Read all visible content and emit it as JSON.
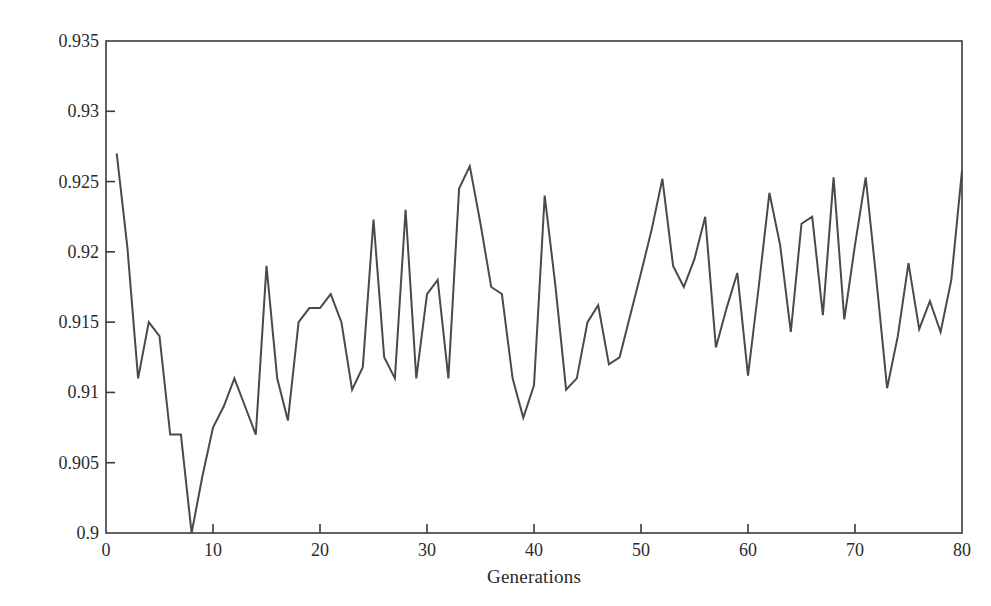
{
  "chart_data": {
    "type": "line",
    "title": "",
    "xlabel": "Generations",
    "ylabel": "Accuracy",
    "xlim": [
      0,
      80
    ],
    "ylim": [
      0.9,
      0.935
    ],
    "grid": false,
    "legend": null,
    "xticks": [
      0,
      10,
      20,
      30,
      40,
      50,
      60,
      70,
      80
    ],
    "xtick_labels": [
      "0",
      "10",
      "20",
      "30",
      "40",
      "50",
      "60",
      "70",
      "80"
    ],
    "yticks": [
      0.9,
      0.905,
      0.91,
      0.915,
      0.92,
      0.925,
      0.93,
      0.935
    ],
    "ytick_labels": [
      "0.9",
      "0.905",
      "0.91",
      "0.915",
      "0.92",
      "0.925",
      "0.93",
      "0.935"
    ],
    "line_color": "#4a4a4a",
    "line_width": 2,
    "x": [
      1,
      2,
      3,
      4,
      5,
      6,
      7,
      8,
      9,
      10,
      11,
      12,
      13,
      14,
      15,
      16,
      17,
      18,
      19,
      20,
      21,
      22,
      23,
      24,
      25,
      26,
      27,
      28,
      29,
      30,
      31,
      32,
      33,
      34,
      35,
      36,
      37,
      38,
      39,
      40,
      41,
      42,
      43,
      44,
      45,
      46,
      47,
      48,
      49,
      50,
      51,
      52,
      53,
      54,
      55,
      56,
      57,
      58,
      59,
      60,
      61,
      62,
      63,
      64,
      65,
      66,
      67,
      68,
      69,
      70,
      71,
      72,
      73,
      74,
      75,
      76,
      77,
      78,
      79,
      80
    ],
    "values": [
      0.927,
      0.9203,
      0.911,
      0.915,
      0.914,
      0.907,
      0.907,
      0.9,
      0.904,
      0.9075,
      0.909,
      0.911,
      0.909,
      0.907,
      0.919,
      0.911,
      0.908,
      0.915,
      0.916,
      0.916,
      0.917,
      0.915,
      0.9102,
      0.9118,
      0.9223,
      0.9125,
      0.911,
      0.923,
      0.911,
      0.917,
      0.918,
      0.911,
      0.9245,
      0.9261,
      0.922,
      0.9175,
      0.917,
      0.911,
      0.9082,
      0.9105,
      0.924,
      0.9176,
      0.9102,
      0.911,
      0.915,
      0.9162,
      0.912,
      0.9125,
      0.9155,
      0.9185,
      0.9216,
      0.9252,
      0.919,
      0.9175,
      0.9195,
      0.9225,
      0.9132,
      0.916,
      0.9185,
      0.9112,
      0.9175,
      0.9242,
      0.9205,
      0.9143,
      0.922,
      0.9225,
      0.9155,
      0.9253,
      0.9152,
      0.9205,
      0.9253,
      0.918,
      0.9103,
      0.914,
      0.9192,
      0.9145,
      0.9165,
      0.9143,
      0.918,
      0.9258
    ]
  },
  "axis": {
    "ylabel_text": "Accuracy",
    "xlabel_text": "Generations"
  }
}
